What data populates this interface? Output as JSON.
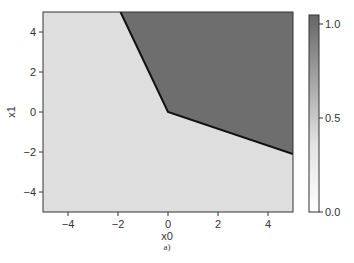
{
  "chart_data": {
    "type": "heatmap",
    "title": "",
    "xlabel": "x0",
    "ylabel": "x1",
    "caption": "a)",
    "xlim": [
      -5,
      5
    ],
    "ylim": [
      -5,
      5
    ],
    "xticks": [
      -4,
      -2,
      0,
      2,
      4
    ],
    "yticks": [
      -4,
      -2,
      0,
      2,
      4
    ],
    "xtick_labels": [
      "−4",
      "−2",
      "0",
      "2",
      "4"
    ],
    "ytick_labels": [
      "−4",
      "−2",
      "0",
      "2",
      "4"
    ],
    "grid": false,
    "regions": [
      {
        "name": "class 0",
        "value": 0.1,
        "color": "#dedede",
        "description": "left / lower region"
      },
      {
        "name": "class 1",
        "value": 1.0,
        "color": "#6e6e6e",
        "description": "upper-right region"
      }
    ],
    "decision_boundary": {
      "points": [
        [
          -1.9,
          5.0
        ],
        [
          0.0,
          0.0
        ],
        [
          5.0,
          -2.1
        ]
      ],
      "color": "#111111"
    },
    "colorbar": {
      "range": [
        0.0,
        1.0
      ],
      "ticks": [
        0.0,
        0.5,
        1.0
      ],
      "tick_labels": [
        "0.0",
        "0.5",
        "1.0"
      ],
      "color_low": "#ffffff",
      "color_high": "#666666"
    }
  }
}
